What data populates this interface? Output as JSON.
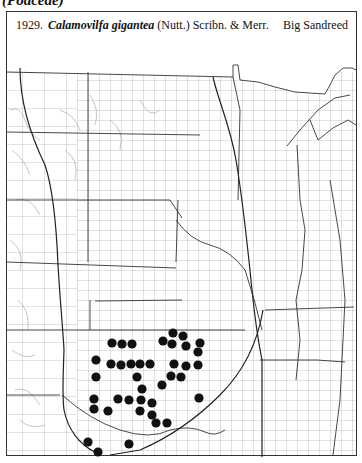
{
  "page": {
    "family_heading": "(Poaceae)"
  },
  "caption": {
    "number": "1929.",
    "scientific_name": "Calamovilfa gigantea",
    "authority": "(Nutt.) Scribn. & Merr.",
    "common_name": "Big Sandreed"
  },
  "map": {
    "region": "Great Plains, central United States",
    "line_color": "#444444",
    "dot_color": "#111111",
    "dot_radius": 4.6,
    "occurrence_dots": [
      [
        112,
        343
      ],
      [
        122,
        344
      ],
      [
        132,
        344
      ],
      [
        163,
        341
      ],
      [
        173,
        333
      ],
      [
        183,
        336
      ],
      [
        172,
        344
      ],
      [
        186,
        346
      ],
      [
        200,
        343
      ],
      [
        96,
        360
      ],
      [
        111,
        364
      ],
      [
        121,
        365
      ],
      [
        131,
        364
      ],
      [
        140,
        364
      ],
      [
        150,
        364
      ],
      [
        174,
        364
      ],
      [
        186,
        366
      ],
      [
        198,
        365
      ],
      [
        198,
        352
      ],
      [
        96,
        377
      ],
      [
        137,
        377
      ],
      [
        171,
        376
      ],
      [
        181,
        377
      ],
      [
        162,
        385
      ],
      [
        142,
        389
      ],
      [
        94,
        399
      ],
      [
        118,
        399
      ],
      [
        129,
        400
      ],
      [
        141,
        400
      ],
      [
        152,
        403
      ],
      [
        199,
        398
      ],
      [
        94,
        409
      ],
      [
        108,
        411
      ],
      [
        140,
        411
      ],
      [
        152,
        415
      ],
      [
        156,
        423
      ],
      [
        167,
        423
      ],
      [
        88,
        442
      ],
      [
        129,
        444
      ],
      [
        98,
        452
      ]
    ]
  }
}
